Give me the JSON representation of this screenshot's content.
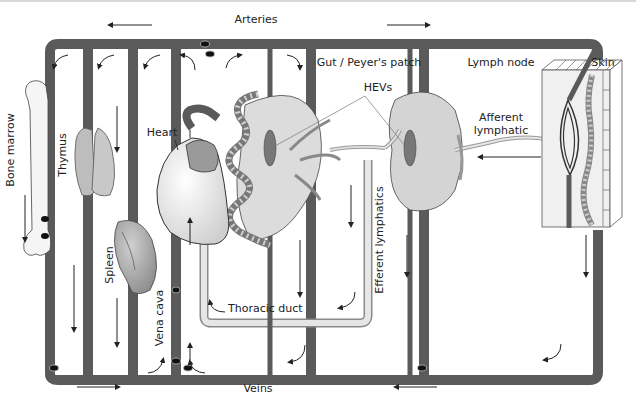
{
  "labels": {
    "arteries": "Arteries",
    "veins": "Veins",
    "bone_marrow": "Bone marrow",
    "thymus": "Thymus",
    "spleen": "Spleen",
    "heart": "Heart",
    "vena_cava": "Vena cava",
    "thoracic_duct": "Thoracic duct",
    "gut": "Gut / Peyer's patch",
    "hevs": "HEVs",
    "efferent": "Efferent lymphatics",
    "lymph_node": "Lymph node",
    "afferent_1": "Afferent",
    "afferent_2": "lymphatic",
    "skin": "Skin"
  },
  "colors": {
    "vessel": "#5a5a5a",
    "lymph_vessel": "#c8c8c8",
    "tissue_fill": "#dcdcdc",
    "organ_fill": "#a8a8a8",
    "cell": "#111111",
    "background": "#ffffff"
  },
  "flow": {
    "arteries_direction": "left-and-right from heart",
    "veins_direction": "toward vena cava",
    "afferent_direction": "skin to lymph node",
    "thoracic_duct_direction": "to heart"
  }
}
